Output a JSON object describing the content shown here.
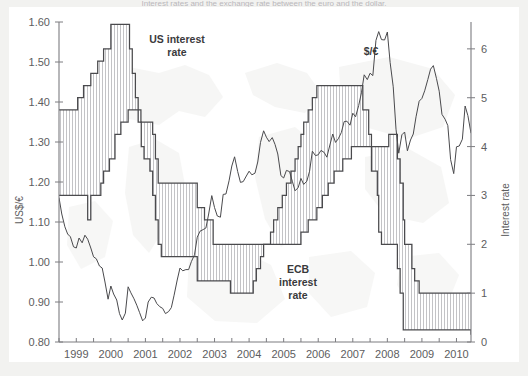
{
  "caption": "Interest rates and the exchange rate between the euro and the dollar.",
  "colors": {
    "line": "#4a4a4d",
    "axis": "#7c7c80",
    "text": "#5d5d60",
    "label": "#2f2f31",
    "hatch": "#b4b4b8",
    "page_bg": "#f2f2f0",
    "figure_bg": "#ffffff"
  },
  "labels": {
    "us_rate": "US interest rate",
    "us_rate_line1": "US interest",
    "us_rate_line2": "rate",
    "ecb_rate_line1": "ECB",
    "ecb_rate_line2": "interest",
    "ecb_rate_line3": "rate",
    "fx": "$/€",
    "left_axis": "US$/€",
    "right_axis": "Interest rate"
  },
  "chart_data": {
    "type": "line",
    "title": "Interest rates and the exchange rate between the euro and the dollar.",
    "xlabel": "",
    "ylabel": "US$/€",
    "y2label": "Interest rate",
    "xlim": [
      1999.0,
      2010.92
    ],
    "ylim": [
      0.8,
      1.6
    ],
    "y2lim": [
      0.0,
      6.55
    ],
    "grid": false,
    "legend": "inline-annotations",
    "left_ticks": [
      "0.80",
      "0.90",
      "1.00",
      "1.10",
      "1.20",
      "1.30",
      "1.40",
      "1.50",
      "1.60"
    ],
    "left_tick_values": [
      0.8,
      0.9,
      1.0,
      1.1,
      1.2,
      1.3,
      1.4,
      1.5,
      1.6
    ],
    "right_ticks": [
      "0",
      "1",
      "2",
      "3",
      "4",
      "5",
      "6"
    ],
    "right_tick_values": [
      0,
      1,
      2,
      3,
      4,
      5,
      6
    ],
    "x_ticks": [
      "1999",
      "2000",
      "2001",
      "2002",
      "2003",
      "2004",
      "2005",
      "2006",
      "2007",
      "2008",
      "2009",
      "2010"
    ],
    "x_tick_values": [
      1999,
      2000,
      2001,
      2002,
      2003,
      2004,
      2005,
      2006,
      2007,
      2008,
      2009,
      2010
    ],
    "x_minor_step": 0.5,
    "series": [
      {
        "name": "$/€",
        "axis": "left",
        "units": "US$ per euro",
        "x": [
          1999.0,
          1999.08,
          1999.17,
          1999.25,
          1999.33,
          1999.42,
          1999.5,
          1999.58,
          1999.67,
          1999.75,
          1999.83,
          1999.92,
          2000.0,
          2000.08,
          2000.17,
          2000.25,
          2000.33,
          2000.42,
          2000.5,
          2000.58,
          2000.67,
          2000.75,
          2000.83,
          2000.92,
          2001.0,
          2001.08,
          2001.17,
          2001.25,
          2001.33,
          2001.42,
          2001.5,
          2001.58,
          2001.67,
          2001.75,
          2001.83,
          2001.92,
          2002.0,
          2002.08,
          2002.17,
          2002.25,
          2002.33,
          2002.42,
          2002.5,
          2002.58,
          2002.67,
          2002.75,
          2002.83,
          2002.92,
          2003.0,
          2003.08,
          2003.17,
          2003.25,
          2003.33,
          2003.42,
          2003.5,
          2003.58,
          2003.67,
          2003.75,
          2003.83,
          2003.92,
          2004.0,
          2004.08,
          2004.17,
          2004.25,
          2004.33,
          2004.42,
          2004.5,
          2004.58,
          2004.67,
          2004.75,
          2004.83,
          2004.92,
          2005.0,
          2005.08,
          2005.17,
          2005.25,
          2005.33,
          2005.42,
          2005.5,
          2005.58,
          2005.67,
          2005.75,
          2005.83,
          2005.92,
          2006.0,
          2006.08,
          2006.17,
          2006.25,
          2006.33,
          2006.42,
          2006.5,
          2006.58,
          2006.67,
          2006.75,
          2006.83,
          2006.92,
          2007.0,
          2007.08,
          2007.17,
          2007.25,
          2007.33,
          2007.42,
          2007.5,
          2007.58,
          2007.67,
          2007.75,
          2007.83,
          2007.92,
          2008.0,
          2008.08,
          2008.17,
          2008.25,
          2008.33,
          2008.42,
          2008.5,
          2008.58,
          2008.67,
          2008.75,
          2008.83,
          2008.92,
          2009.0,
          2009.08,
          2009.17,
          2009.25,
          2009.33,
          2009.42,
          2009.5,
          2009.58,
          2009.67,
          2009.75,
          2009.83,
          2009.92,
          2010.0,
          2010.08,
          2010.17,
          2010.25,
          2010.33,
          2010.42,
          2010.5,
          2010.58,
          2010.67,
          2010.75,
          2010.83,
          2010.92
        ],
        "y": [
          1.161,
          1.12,
          1.088,
          1.07,
          1.063,
          1.038,
          1.035,
          1.06,
          1.048,
          1.067,
          1.057,
          1.035,
          1.013,
          1.008,
          0.99,
          0.985,
          0.95,
          0.907,
          0.94,
          0.92,
          0.905,
          0.871,
          0.855,
          0.872,
          0.938,
          0.923,
          0.908,
          0.892,
          0.874,
          0.853,
          0.86,
          0.9,
          0.912,
          0.91,
          0.896,
          0.888,
          0.884,
          0.871,
          0.876,
          0.886,
          0.917,
          0.955,
          0.985,
          0.978,
          0.981,
          0.981,
          1.001,
          1.018,
          1.062,
          1.077,
          1.081,
          1.085,
          1.12,
          1.166,
          1.136,
          1.115,
          1.112,
          1.169,
          1.17,
          1.203,
          1.24,
          1.263,
          1.226,
          1.199,
          1.201,
          1.215,
          1.227,
          1.218,
          1.222,
          1.25,
          1.299,
          1.328,
          1.312,
          1.301,
          1.311,
          1.294,
          1.27,
          1.216,
          1.21,
          1.229,
          1.226,
          1.202,
          1.178,
          1.186,
          1.209,
          1.194,
          1.202,
          1.227,
          1.277,
          1.266,
          1.268,
          1.279,
          1.274,
          1.262,
          1.29,
          1.32,
          1.299,
          1.308,
          1.324,
          1.351,
          1.352,
          1.342,
          1.372,
          1.363,
          1.391,
          1.423,
          1.468,
          1.456,
          1.472,
          1.466,
          1.554,
          1.576,
          1.556,
          1.555,
          1.575,
          1.499,
          1.438,
          1.332,
          1.272,
          1.318,
          1.325,
          1.278,
          1.305,
          1.32,
          1.363,
          1.402,
          1.409,
          1.428,
          1.456,
          1.482,
          1.491,
          1.459,
          1.427,
          1.369,
          1.357,
          1.341,
          1.256,
          1.221,
          1.288,
          1.29,
          1.307,
          1.39,
          1.366,
          1.322
        ]
      },
      {
        "name": "US interest rate",
        "axis": "right",
        "units": "percent",
        "note": "Federal funds target rate; step function",
        "x": [
          1999.0,
          1999.5,
          1999.54,
          1999.63,
          1999.71,
          1999.83,
          1999.92,
          2000.04,
          2000.12,
          2000.21,
          2000.29,
          2000.38,
          2000.5,
          2000.79,
          2001.0,
          2001.04,
          2001.12,
          2001.21,
          2001.29,
          2001.38,
          2001.46,
          2001.54,
          2001.63,
          2001.71,
          2001.79,
          2001.87,
          2001.96,
          2002.0,
          2002.88,
          2003.0,
          2003.46,
          2003.96,
          2004.0,
          2004.5,
          2004.62,
          2004.71,
          2004.83,
          2004.92,
          2005.0,
          2005.12,
          2005.21,
          2005.33,
          2005.46,
          2005.58,
          2005.71,
          2005.83,
          2005.92,
          2006.0,
          2006.08,
          2006.21,
          2006.33,
          2006.46,
          2006.5,
          2007.0,
          2007.7,
          2007.79,
          2007.96,
          2008.04,
          2008.21,
          2008.25,
          2008.33,
          2008.75,
          2008.79,
          2008.87,
          2008.96,
          2009.0,
          2010.92
        ],
        "y": [
          4.75,
          4.75,
          5.0,
          5.0,
          5.25,
          5.25,
          5.5,
          5.5,
          5.75,
          5.75,
          6.0,
          6.0,
          6.5,
          6.5,
          6.5,
          6.0,
          5.5,
          5.0,
          4.5,
          4.0,
          3.75,
          3.75,
          3.5,
          3.0,
          2.5,
          2.0,
          1.75,
          1.75,
          1.75,
          1.25,
          1.25,
          1.0,
          1.0,
          1.0,
          1.25,
          1.5,
          1.75,
          2.0,
          2.0,
          2.25,
          2.5,
          2.75,
          3.0,
          3.25,
          3.5,
          3.75,
          4.0,
          4.25,
          4.5,
          4.75,
          5.0,
          5.25,
          5.25,
          5.25,
          5.25,
          4.75,
          4.25,
          3.5,
          3.0,
          2.25,
          2.0,
          2.0,
          1.5,
          1.0,
          0.25,
          0.25,
          0.15
        ],
        "step_levels_percent": [
          4.75,
          5.0,
          5.25,
          5.5,
          5.75,
          6.0,
          6.5,
          4.0,
          3.0,
          2.0,
          1.75,
          1.25,
          1.0,
          2.0,
          3.0,
          4.0,
          5.25,
          4.25,
          2.0,
          1.0,
          0.25,
          0.15
        ]
      },
      {
        "name": "ECB interest rate",
        "axis": "right",
        "units": "percent",
        "note": "ECB main refinancing rate; step function",
        "x": [
          1999.0,
          1999.29,
          1999.83,
          1999.92,
          2000.08,
          2000.21,
          2000.29,
          2000.46,
          2000.62,
          2000.79,
          2001.0,
          2001.37,
          2001.71,
          2001.79,
          2001.87,
          2001.96,
          2002.0,
          2002.96,
          2003.0,
          2003.21,
          2003.46,
          2003.96,
          2004.0,
          2004.96,
          2005.0,
          2005.96,
          2006.0,
          2006.12,
          2006.21,
          2006.46,
          2006.62,
          2006.79,
          2006.96,
          2007.0,
          2007.21,
          2007.46,
          2007.96,
          2008.0,
          2008.54,
          2008.79,
          2008.87,
          2008.96,
          2009.0,
          2009.08,
          2009.21,
          2009.29,
          2009.42,
          2009.96,
          2010.0,
          2010.92
        ],
        "y": [
          3.0,
          3.0,
          2.5,
          3.0,
          3.0,
          3.25,
          3.5,
          3.75,
          4.25,
          4.5,
          4.75,
          4.5,
          4.25,
          3.75,
          3.25,
          3.25,
          3.25,
          3.25,
          2.75,
          2.5,
          2.0,
          2.0,
          2.0,
          2.0,
          2.0,
          2.0,
          2.25,
          2.25,
          2.5,
          2.75,
          3.0,
          3.25,
          3.5,
          3.5,
          3.75,
          4.0,
          4.0,
          4.0,
          4.25,
          3.75,
          3.25,
          2.5,
          2.0,
          2.0,
          1.5,
          1.25,
          1.0,
          1.0,
          1.0,
          1.0
        ],
        "step_levels_percent": [
          3.0,
          2.5,
          3.0,
          3.25,
          3.5,
          3.75,
          4.25,
          4.5,
          4.75,
          4.5,
          4.25,
          3.75,
          3.25,
          2.75,
          2.5,
          2.0,
          2.25,
          2.5,
          2.75,
          3.0,
          3.25,
          3.5,
          3.75,
          4.0,
          4.25,
          3.75,
          3.25,
          2.5,
          2.0,
          1.5,
          1.25,
          1.0
        ]
      }
    ],
    "annotations": [
      {
        "text": "US interest rate",
        "x": 2000.3,
        "y_axis": "right",
        "y": 6.2
      },
      {
        "text": "ECB interest rate",
        "x": 2005.3,
        "y_axis": "right",
        "y": 1.7
      },
      {
        "text": "$/€",
        "x": 2007.4,
        "y_axis": "left",
        "y": 1.54
      }
    ],
    "shading": {
      "description": "Vertical hatch fill between the US interest rate step curve and the ECB interest rate step curve",
      "pattern": "vertical-lines"
    }
  }
}
